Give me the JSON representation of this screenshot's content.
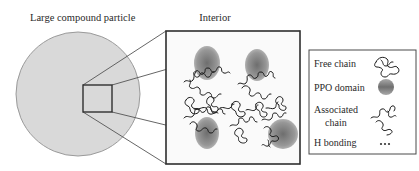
{
  "diagram": {
    "particle_label": "Large compound particle",
    "interior_label": "Interior",
    "colors": {
      "particle_fill": "#d9d9d9",
      "particle_stroke": "#9a9a9a",
      "box_stroke": "#2f2f2f",
      "connector": "#555555",
      "ppo_domain": "#8c8c8c",
      "chain": "#1a1a1a"
    }
  },
  "legend": {
    "items": [
      {
        "label": "Free chain",
        "icon": "free-chain-icon"
      },
      {
        "label": "PPO domain",
        "icon": "ppo-domain-icon"
      },
      {
        "label": "Associated",
        "label2": "chain",
        "icon": "associated-chain-icon"
      },
      {
        "label": "H bonding",
        "icon": "h-bonding-icon",
        "symbol": "•••"
      }
    ]
  }
}
